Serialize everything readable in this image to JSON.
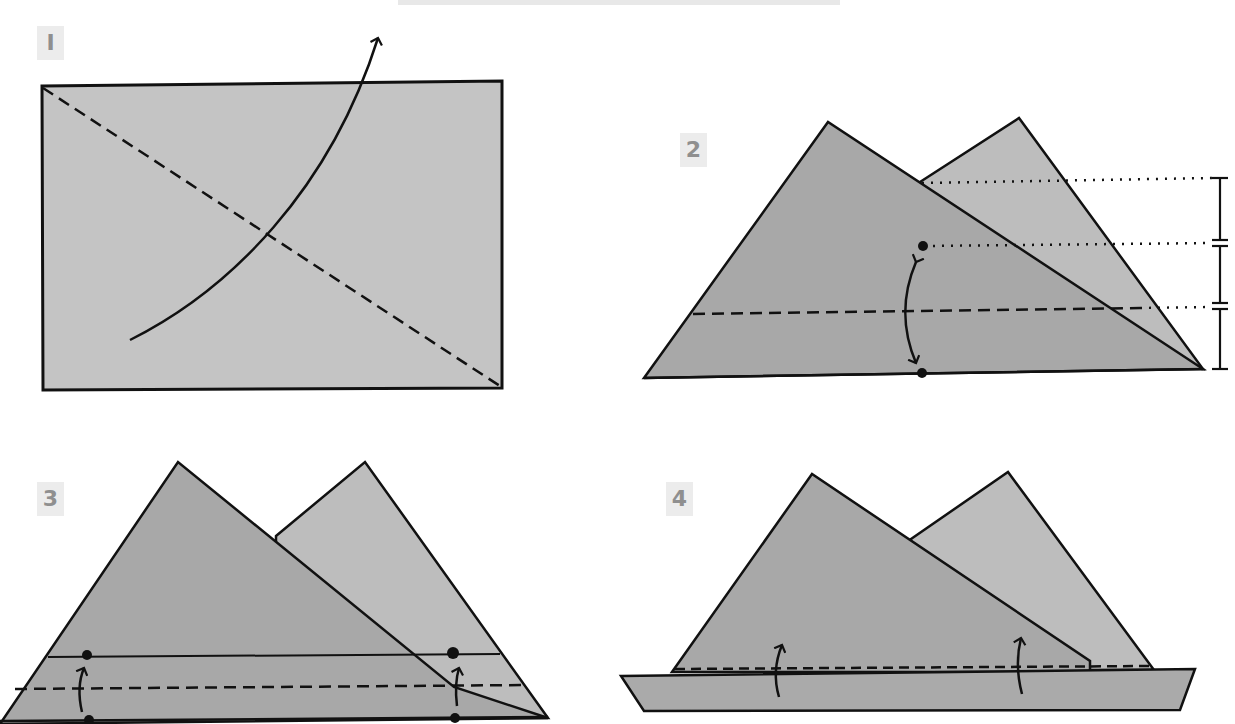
{
  "header": {
    "title_bar": ""
  },
  "steps": [
    {
      "number": "1",
      "badge_label": "I"
    },
    {
      "number": "2",
      "badge_label": "2"
    },
    {
      "number": "3",
      "badge_label": "3"
    },
    {
      "number": "4",
      "badge_label": "4"
    }
  ],
  "colors": {
    "paper_light": "#c4c4c4",
    "paper_front": "#a8a8a8",
    "paper_back": "#bdbdbd",
    "line": "#111111",
    "badge_bg": "#ececec",
    "badge_text": "#8f8f8f"
  },
  "legend": {
    "dashed_line": "valley fold",
    "dotted_line": "reference",
    "arrow": "fold direction",
    "dot": "reference point"
  }
}
